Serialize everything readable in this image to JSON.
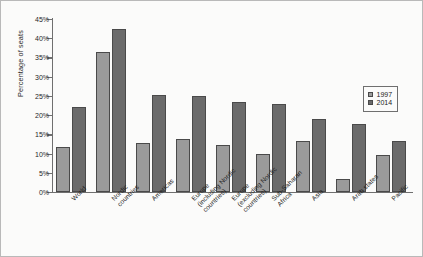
{
  "chart_data": {
    "type": "bar",
    "title": "",
    "xlabel": "",
    "ylabel": "Percentage of seats",
    "ylim": [
      0,
      45
    ],
    "ytick_labels": [
      "0%",
      "5%",
      "10%",
      "15%",
      "20%",
      "25%",
      "30%",
      "35%",
      "40%",
      "45%"
    ],
    "ytick_values": [
      0,
      5,
      10,
      15,
      20,
      25,
      30,
      35,
      40,
      45
    ],
    "grid": false,
    "legend_position": "right",
    "categories": [
      "World",
      "Nordic\ncountries",
      "Americas",
      "Europe\n(including Nordic\ncountries)",
      "Europe\n(excluding Nordic\ncountries)",
      "Sub-Saharan\nAfrica",
      "Asia",
      "Arab states",
      "Pacific"
    ],
    "series": [
      {
        "name": "1997",
        "color": "#9b9b9b",
        "values": [
          11.7,
          36.5,
          12.8,
          13.8,
          12.2,
          10.0,
          13.3,
          3.3,
          9.7
        ]
      },
      {
        "name": "2014",
        "color": "#6b6b6b",
        "values": [
          22.1,
          42.3,
          25.2,
          25.1,
          23.5,
          23.0,
          18.9,
          17.7,
          13.3
        ]
      }
    ]
  }
}
